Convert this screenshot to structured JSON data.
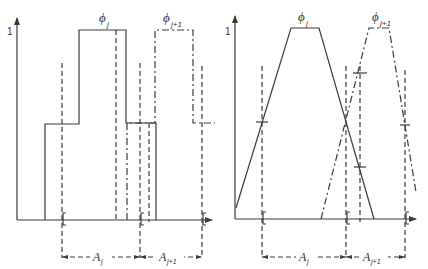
{
  "figure": {
    "colors": {
      "ink": "#3a3a3a",
      "background": "#ffffff"
    },
    "left_panel": {
      "y_tick_label": "1",
      "phi_j": {
        "symbol": "ϕ",
        "subscript": "j",
        "shape": "step (piecewise constant)",
        "line": "solid"
      },
      "phi_j1": {
        "symbol": "ϕ",
        "subscript": "j+1",
        "shape": "step (piecewise constant)",
        "line": "dash-dot"
      },
      "interval_j": {
        "symbol": "A",
        "subscript": "j"
      },
      "interval_j1": {
        "symbol": "A",
        "subscript": "j+1"
      }
    },
    "right_panel": {
      "y_tick_label": "1",
      "phi_j": {
        "symbol": "ϕ",
        "subscript": "j",
        "shape": "trapezoid (piecewise linear)",
        "line": "solid"
      },
      "phi_j1": {
        "symbol": "ϕ",
        "subscript": "j+1",
        "shape": "trapezoid (piecewise linear)",
        "line": "dash-dot"
      },
      "interval_j": {
        "symbol": "A",
        "subscript": "j"
      },
      "interval_j1": {
        "symbol": "A",
        "subscript": "j+1"
      }
    }
  }
}
